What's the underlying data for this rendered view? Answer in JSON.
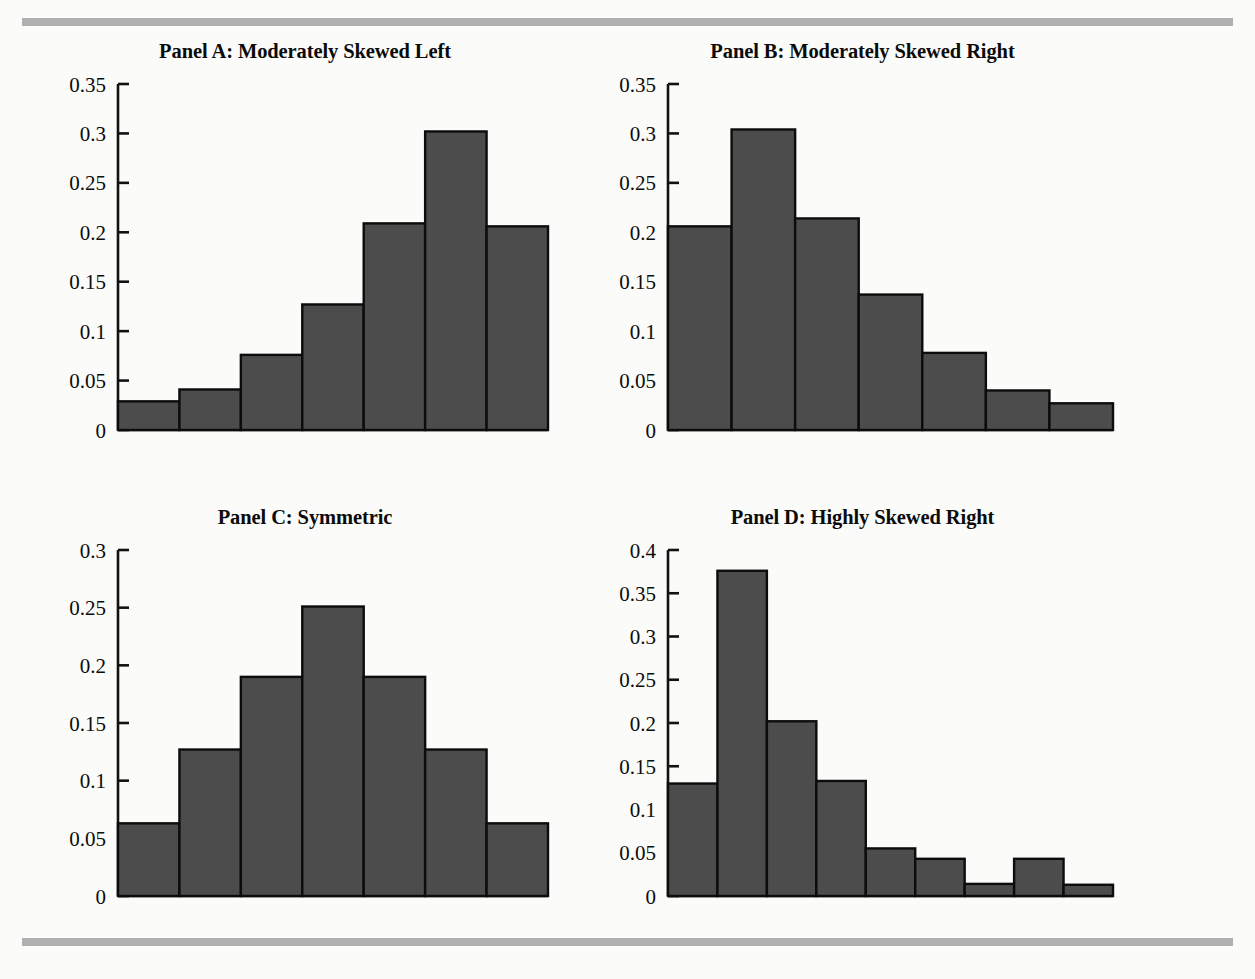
{
  "figure": {
    "background_color": "#fbfbfa",
    "rule_color": "#b0b0b0",
    "bar_fill_color": "#4c4c4c",
    "bar_border_color": "#0c0c0c",
    "axis_color": "#121212",
    "ghost_header": ""
  },
  "chart_data": [
    {
      "type": "bar",
      "title": "Panel A: Moderately Skewed Left",
      "xlabel": "",
      "ylabel": "",
      "ylim": [
        0,
        0.35
      ],
      "yticks": [
        0,
        0.05,
        0.1,
        0.15,
        0.2,
        0.25,
        0.3,
        0.35
      ],
      "ytick_labels": [
        "0",
        "0.05",
        "0.1",
        "0.15",
        "0.2",
        "0.25",
        "0.3",
        "0.35"
      ],
      "grid": false,
      "legend": "none",
      "categories": [
        "1",
        "2",
        "3",
        "4",
        "5",
        "6",
        "7"
      ],
      "values": [
        0.029,
        0.041,
        0.076,
        0.127,
        0.209,
        0.302,
        0.206
      ]
    },
    {
      "type": "bar",
      "title": "Panel B: Moderately Skewed Right",
      "xlabel": "",
      "ylabel": "",
      "ylim": [
        0,
        0.35
      ],
      "yticks": [
        0,
        0.05,
        0.1,
        0.15,
        0.2,
        0.25,
        0.3,
        0.35
      ],
      "ytick_labels": [
        "0",
        "0.05",
        "0.1",
        "0.15",
        "0.2",
        "0.25",
        "0.3",
        "0.35"
      ],
      "grid": false,
      "legend": "none",
      "categories": [
        "1",
        "2",
        "3",
        "4",
        "5",
        "6",
        "7"
      ],
      "values": [
        0.206,
        0.304,
        0.214,
        0.137,
        0.078,
        0.04,
        0.027
      ]
    },
    {
      "type": "bar",
      "title": "Panel C: Symmetric",
      "xlabel": "",
      "ylabel": "",
      "ylim": [
        0,
        0.3
      ],
      "yticks": [
        0,
        0.05,
        0.1,
        0.15,
        0.2,
        0.25,
        0.3
      ],
      "ytick_labels": [
        "0",
        "0.05",
        "0.1",
        "0.15",
        "0.2",
        "0.25",
        "0.3"
      ],
      "grid": false,
      "legend": "none",
      "categories": [
        "1",
        "2",
        "3",
        "4",
        "5",
        "6",
        "7"
      ],
      "values": [
        0.063,
        0.127,
        0.19,
        0.251,
        0.19,
        0.127,
        0.063
      ]
    },
    {
      "type": "bar",
      "title": "Panel D: Highly Skewed Right",
      "xlabel": "",
      "ylabel": "",
      "ylim": [
        0,
        0.4
      ],
      "yticks": [
        0,
        0.05,
        0.1,
        0.15,
        0.2,
        0.25,
        0.3,
        0.35,
        0.4
      ],
      "ytick_labels": [
        "0",
        "0.05",
        "0.1",
        "0.15",
        "0.2",
        "0.25",
        "0.3",
        "0.35",
        "0.4"
      ],
      "grid": false,
      "legend": "none",
      "categories": [
        "1",
        "2",
        "3",
        "4",
        "5",
        "6",
        "7",
        "8",
        "9"
      ],
      "values": [
        0.13,
        0.376,
        0.202,
        0.133,
        0.055,
        0.043,
        0.014,
        0.043,
        0.013
      ]
    }
  ]
}
